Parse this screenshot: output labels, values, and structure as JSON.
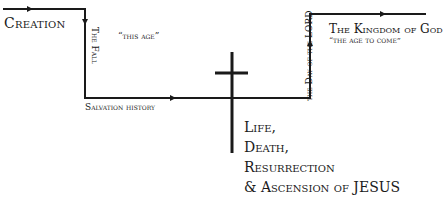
{
  "diagram": {
    "labels": {
      "creation": "Creation",
      "the_fall": "The Fall",
      "this_age": "“this age”",
      "salvation_history": "Salvation history",
      "kingdom_of_god": "The Kingdom of God",
      "age_to_come": "“the age to come”",
      "day_of_the_lord": "the Day of the LORD",
      "jesus_lines": [
        "Life,",
        "Death,",
        "Resurrection",
        "& Ascension of JESUS"
      ]
    },
    "colors": {
      "line": "#1a1a1a",
      "background": "#ffffff"
    }
  }
}
